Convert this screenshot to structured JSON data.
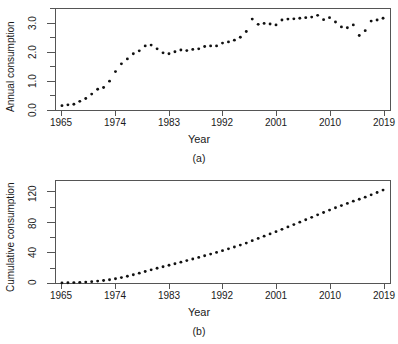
{
  "figure": {
    "panels": [
      {
        "id": "a",
        "subcaption": "(a)",
        "xlabel": "Year",
        "ylabel": "Annual consumption"
      },
      {
        "id": "b",
        "subcaption": "(b)",
        "xlabel": "Year",
        "ylabel": "Cumulative consumption"
      }
    ]
  },
  "chart_data": [
    {
      "type": "scatter",
      "panel": "(a)",
      "title": "",
      "xlabel": "Year",
      "ylabel": "Annual consumption",
      "xlim": [
        1963,
        2021
      ],
      "ylim": [
        0.0,
        3.5
      ],
      "xticks": [
        1965,
        1974,
        1983,
        1992,
        2001,
        2010,
        2019
      ],
      "xtick_labels": [
        "1965",
        "1974",
        "1983",
        "1992",
        "2001",
        "2010",
        "2019"
      ],
      "yticks": [
        0.0,
        1.0,
        2.0,
        3.0
      ],
      "ytick_labels": [
        "0.0",
        "1.0",
        "2.0",
        "3.0"
      ],
      "yminor_ticks": [
        0.5,
        1.5,
        2.5,
        3.5
      ],
      "grid": false,
      "legend": null,
      "marker": "filled-circle",
      "marker_color": "#111111",
      "x": [
        1965,
        1966,
        1967,
        1968,
        1969,
        1970,
        1971,
        1972,
        1973,
        1974,
        1975,
        1976,
        1977,
        1978,
        1979,
        1980,
        1981,
        1982,
        1983,
        1984,
        1985,
        1986,
        1987,
        1988,
        1989,
        1990,
        1991,
        1992,
        1993,
        1994,
        1995,
        1996,
        1997,
        1998,
        1999,
        2000,
        2001,
        2002,
        2003,
        2004,
        2005,
        2006,
        2007,
        2008,
        2009,
        2010,
        2011,
        2012,
        2013,
        2014,
        2015,
        2016,
        2017,
        2018,
        2019
      ],
      "y": [
        0.15,
        0.18,
        0.2,
        0.3,
        0.4,
        0.55,
        0.72,
        0.78,
        1.0,
        1.33,
        1.6,
        1.77,
        1.95,
        2.05,
        2.22,
        2.25,
        2.12,
        1.98,
        1.95,
        2.02,
        2.08,
        2.06,
        2.1,
        2.12,
        2.2,
        2.22,
        2.22,
        2.32,
        2.36,
        2.42,
        2.52,
        2.72,
        3.15,
        2.97,
        3.0,
        2.98,
        2.95,
        3.12,
        3.15,
        3.16,
        3.18,
        3.2,
        3.22,
        3.28,
        3.13,
        3.2,
        3.05,
        2.88,
        2.85,
        2.95,
        2.58,
        2.75,
        3.08,
        3.12,
        3.18
      ]
    },
    {
      "type": "scatter",
      "panel": "(b)",
      "title": "",
      "xlabel": "Year",
      "ylabel": "Cumulative consumption",
      "xlim": [
        1963,
        2021
      ],
      "ylim": [
        0,
        135
      ],
      "xticks": [
        1965,
        1974,
        1983,
        1992,
        2001,
        2010,
        2019
      ],
      "xtick_labels": [
        "1965",
        "1974",
        "1983",
        "1992",
        "2001",
        "2010",
        "2019"
      ],
      "yticks": [
        0,
        40,
        80,
        120
      ],
      "ytick_labels": [
        "0",
        "40",
        "80",
        "120"
      ],
      "yminor_ticks": [
        20,
        60,
        100
      ],
      "grid": false,
      "legend": null,
      "marker": "filled-circle",
      "marker_color": "#111111",
      "x": [
        1965,
        1966,
        1967,
        1968,
        1969,
        1970,
        1971,
        1972,
        1973,
        1974,
        1975,
        1976,
        1977,
        1978,
        1979,
        1980,
        1981,
        1982,
        1983,
        1984,
        1985,
        1986,
        1987,
        1988,
        1989,
        1990,
        1991,
        1992,
        1993,
        1994,
        1995,
        1996,
        1997,
        1998,
        1999,
        2000,
        2001,
        2002,
        2003,
        2004,
        2005,
        2006,
        2007,
        2008,
        2009,
        2010,
        2011,
        2012,
        2013,
        2014,
        2015,
        2016,
        2017,
        2018,
        2019
      ],
      "y": [
        0.15,
        0.33,
        0.53,
        0.83,
        1.23,
        1.78,
        2.5,
        3.28,
        4.28,
        5.61,
        7.21,
        8.98,
        10.93,
        12.98,
        15.2,
        17.45,
        19.57,
        21.55,
        23.5,
        25.52,
        27.6,
        29.66,
        31.76,
        33.88,
        36.08,
        38.3,
        40.52,
        42.84,
        45.2,
        47.62,
        50.14,
        52.86,
        56.01,
        58.98,
        61.98,
        64.96,
        67.91,
        71.03,
        74.18,
        77.34,
        80.52,
        83.72,
        86.94,
        90.22,
        93.35,
        96.55,
        99.6,
        102.48,
        105.33,
        108.28,
        110.86,
        113.61,
        116.69,
        119.81,
        122.99
      ]
    }
  ]
}
